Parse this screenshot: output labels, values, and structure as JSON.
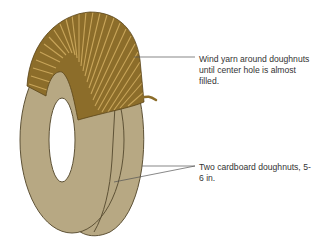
{
  "figure": {
    "labels": {
      "wind_yarn": "Wind yarn around doughnuts until center hole is almost filled.",
      "cardboard": "Two cardboard doughnuts, 5-6 in."
    },
    "colors": {
      "cardboard_fill": "#b7a883",
      "cardboard_edge": "#5e5236",
      "yarn_fill": "#8c6d2a",
      "yarn_line": "#c8a55a",
      "leader_line": "#555555"
    }
  }
}
